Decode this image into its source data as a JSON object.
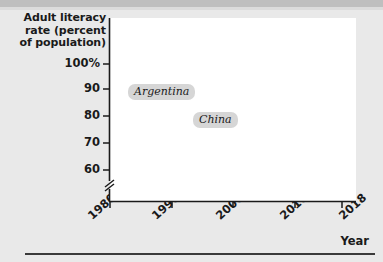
{
  "chart_data": {
    "type": "line",
    "title": "Adult literacy rate (percent of population)",
    "xlabel": "Year",
    "ylabel": "Adult literacy rate (percent of population)",
    "x": [
      1980,
      1990,
      2000,
      2010,
      2018
    ],
    "xlim": [
      1980,
      2018
    ],
    "ylim": [
      60,
      100
    ],
    "y_axis_break": true,
    "y_axis_break_symbol": "//",
    "grid": false,
    "legend_position": "inline-labels",
    "ytick_labels": [
      "100%",
      "90",
      "80",
      "70",
      "60"
    ],
    "ytick_values": [
      100,
      90,
      80,
      70,
      60
    ],
    "xtick_labels": [
      "1980",
      "1990",
      "2000",
      "2010",
      "2018"
    ],
    "xtick_values": [
      1980,
      1990,
      2000,
      2010,
      2018
    ],
    "series": [
      {
        "name": "Argentina",
        "color": "#1a1a1a",
        "values": [
          94.0,
          95.7,
          96.8,
          98.1,
          99.0
        ]
      },
      {
        "name": "China",
        "color": "#b0b0b0",
        "values": [
          65.5,
          78.0,
          91.0,
          95.0,
          96.8
        ]
      }
    ]
  },
  "axis": {
    "y_title_line1": "Adult literacy",
    "y_title_line2": "rate (percent",
    "y_title_line3": "of population)",
    "x_title": "Year"
  },
  "ytick_labels": {
    "t0": "100%",
    "t1": "90",
    "t2": "80",
    "t3": "70",
    "t4": "60"
  },
  "xtick_labels": {
    "t0": "1980",
    "t1": "1990",
    "t2": "2000",
    "t3": "2010",
    "t4": "2018"
  },
  "series_labels": {
    "argentina": "Argentina",
    "china": "China"
  },
  "colors": {
    "argentina_line": "#1a1a1a",
    "china_line": "#b0b0b0",
    "page_background": "#e9e9e9",
    "plot_background": "#ffffff",
    "label_pill": "#d6d6d6",
    "axis": "#1a1a1a"
  }
}
